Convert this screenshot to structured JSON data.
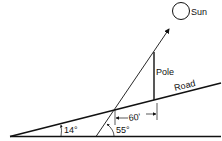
{
  "diagram": {
    "labels": {
      "sun": "Sun",
      "pole": "Pole",
      "road": "Road",
      "distance": "60'",
      "road_angle": "14°",
      "sun_angle": "55°"
    },
    "colors": {
      "stroke": "#111111",
      "background": "#ffffff"
    }
  }
}
